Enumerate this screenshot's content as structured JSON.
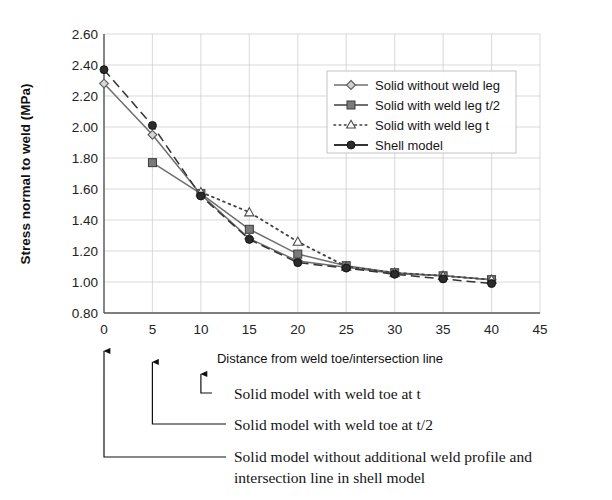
{
  "chart_data": {
    "type": "line",
    "title": "",
    "xlabel": "Distance from weld toe/intersection line",
    "ylabel": "Stress normal to weld (MPa)",
    "xlim": [
      0,
      45
    ],
    "ylim": [
      0.8,
      2.6
    ],
    "xticks": [
      "0",
      "5",
      "10",
      "15",
      "20",
      "25",
      "30",
      "35",
      "40",
      "45"
    ],
    "yticks": [
      "0.80",
      "1.00",
      "1.20",
      "1.40",
      "1.60",
      "1.80",
      "2.00",
      "2.20",
      "2.40",
      "2.60"
    ],
    "grid": true,
    "legend_position": "top-right",
    "x": [
      0,
      5,
      10,
      15,
      20,
      25,
      30,
      35,
      40
    ],
    "series": [
      {
        "name": "Solid without weld leg",
        "marker": "diamond-open",
        "line": "solid",
        "color": "#6e6e6e",
        "values": [
          2.28,
          1.95,
          1.565,
          1.28,
          1.135,
          1.095,
          1.055,
          1.04,
          1.015
        ]
      },
      {
        "name": "Solid with weld leg t/2",
        "marker": "square-filled",
        "line": "solid",
        "color": "#6e6e6e",
        "values": [
          null,
          1.77,
          1.57,
          1.34,
          1.18,
          1.105,
          1.06,
          1.04,
          1.015
        ]
      },
      {
        "name": "Solid with weld leg t",
        "marker": "triangle-open",
        "line": "dotted",
        "color": "#444444",
        "values": [
          null,
          null,
          1.58,
          1.45,
          1.26,
          1.1,
          1.06,
          1.04,
          1.015
        ]
      },
      {
        "name": "Shell model",
        "marker": "circle-filled",
        "line": "dashed",
        "color": "#333333",
        "values": [
          2.37,
          2.01,
          1.555,
          1.275,
          1.125,
          1.09,
          1.05,
          1.02,
          0.99
        ]
      }
    ]
  },
  "legend": {
    "entries": [
      {
        "label": "Solid without weld leg"
      },
      {
        "label": "Solid with weld leg t/2"
      },
      {
        "label": "Solid with weld leg t"
      },
      {
        "label": "Shell model"
      }
    ]
  },
  "annotations": [
    {
      "id": "annot-t",
      "text": "Solid model with weld toe at t"
    },
    {
      "id": "annot-t2",
      "text": "Solid model with weld toe at t/2"
    },
    {
      "id": "annot-none-line1",
      "text": "Solid model without additional weld profile and"
    },
    {
      "id": "annot-none-line2",
      "text": "intersection line in shell model"
    }
  ]
}
